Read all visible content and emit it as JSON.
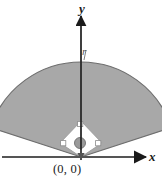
{
  "figure": {
    "type": "math-diagram",
    "axes": {
      "x_label": "x",
      "y_label": "y",
      "origin_label": "(0, 0)",
      "x_axis_y": 157,
      "y_axis_x": 81,
      "axis_color": "#555555",
      "arrow_color": "#1a1a1a"
    },
    "radius_label": "r",
    "colors": {
      "sector_fill": "#a8a8a8",
      "sector_stroke": "#6e6e6e",
      "square_fill": "#ffffff",
      "square_stroke": "#9a9a9a",
      "dot_fill": "#9a9a9a",
      "dot_stroke": "#6e6e6e",
      "right_angle_fill": "#ffffff",
      "right_angle_stroke": "#8a8a8a",
      "background": "#ffffff"
    },
    "geometry": {
      "sector_center_x": 81,
      "sector_center_y": 157,
      "sector_outer_radius": 95,
      "sector_start_angle_deg": 18,
      "sector_end_angle_deg": 162,
      "square_top": [
        81,
        121
      ],
      "square_left": [
        60,
        143
      ],
      "square_right": [
        102,
        143
      ],
      "square_bottom": [
        81,
        157
      ],
      "dot_center": [
        80,
        143
      ],
      "dot_radius": 5.5
    }
  }
}
